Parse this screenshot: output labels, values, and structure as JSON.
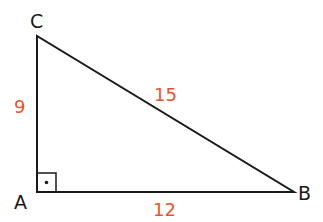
{
  "diagram": {
    "type": "right-triangle",
    "colors": {
      "line": "#1a1a1a",
      "side_label": "#e8552c"
    },
    "vertices": [
      {
        "name": "C",
        "label": "C",
        "x": 37,
        "y": 36
      },
      {
        "name": "A",
        "label": "A",
        "x": 37,
        "y": 192
      },
      {
        "name": "B",
        "label": "B",
        "x": 294,
        "y": 192
      }
    ],
    "sides": [
      {
        "between": "AC",
        "length": "9"
      },
      {
        "between": "CB",
        "length": "15"
      },
      {
        "between": "AB",
        "length": "12"
      }
    ],
    "right_angle_at": "A"
  }
}
